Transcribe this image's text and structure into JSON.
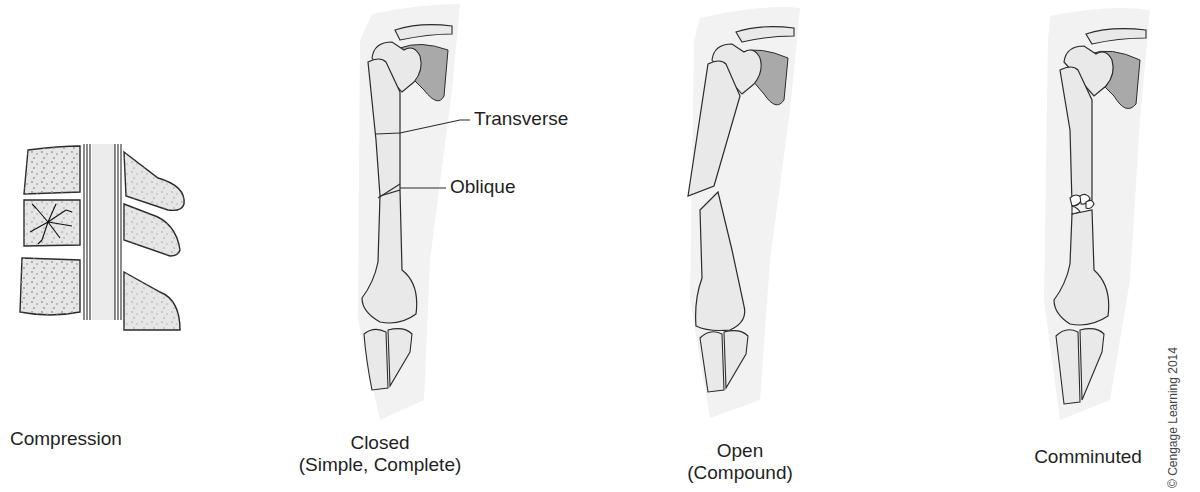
{
  "figure": {
    "panels": [
      {
        "id": "compression",
        "label_lines": [
          "Compression"
        ]
      },
      {
        "id": "closed",
        "label_lines": [
          "Closed",
          "(Simple, Complete)"
        ]
      },
      {
        "id": "open",
        "label_lines": [
          "Open",
          "(Compound)"
        ]
      },
      {
        "id": "comminuted",
        "label_lines": [
          "Comminuted"
        ]
      }
    ],
    "callouts": {
      "transverse": "Transverse",
      "oblique": "Oblique"
    },
    "credit": "© Cengage Learning 2014"
  },
  "colors": {
    "bone_fill": "#e9e9e9",
    "bone_shade": "#cfcfcf",
    "scapula_shade": "#a8a8a8",
    "skin_halo": "#f1f1f1",
    "outline": "#2b2b2b"
  }
}
